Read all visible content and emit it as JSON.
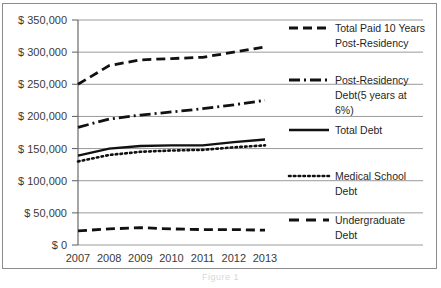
{
  "figure": {
    "caption": "Figure 1",
    "border_color": "#8c8c8c",
    "background": "#ffffff"
  },
  "chart_data": {
    "type": "line",
    "title": "",
    "xlabel": "",
    "ylabel": "",
    "grid": true,
    "legend_position": "right",
    "x": [
      2007,
      2008,
      2009,
      2010,
      2011,
      2012,
      2013
    ],
    "categories": [
      "2007",
      "2008",
      "2009",
      "2010",
      "2011",
      "2012",
      "2013"
    ],
    "ylim": [
      0,
      350000
    ],
    "yticks": [
      0,
      50000,
      100000,
      150000,
      200000,
      250000,
      300000,
      350000
    ],
    "ytick_labels": [
      "$ 0",
      "$ 50,000",
      "$ 100,000",
      "$ 150,000",
      "$ 200,000",
      "$ 250,000",
      "$ 300,000",
      "$ 350,000"
    ],
    "xtick_labels": [
      "2007",
      "2008",
      "2009",
      "2010",
      "2011",
      "2012",
      "2013"
    ],
    "series": [
      {
        "name": "Total Paid 10 Years Post-Residency",
        "values": [
          250000,
          279000,
          288000,
          290000,
          292000,
          300000,
          308000
        ],
        "style": "dashed",
        "color": "#111111"
      },
      {
        "name": "Post-Residency Debt(5 years at 6%)",
        "values": [
          183000,
          196000,
          202000,
          207000,
          212000,
          218000,
          225000
        ],
        "style": "dash-dot",
        "color": "#111111"
      },
      {
        "name": "Total Debt",
        "values": [
          139000,
          150000,
          154000,
          155000,
          155000,
          160000,
          164000
        ],
        "style": "solid",
        "color": "#111111"
      },
      {
        "name": "Medical School Debt",
        "values": [
          130000,
          140000,
          145000,
          147000,
          148000,
          152000,
          155000
        ],
        "style": "dotted",
        "color": "#111111"
      },
      {
        "name": "Undergraduate Debt",
        "values": [
          22000,
          25000,
          27000,
          25000,
          24000,
          24000,
          23000
        ],
        "style": "dashed",
        "color": "#111111"
      }
    ]
  },
  "legend": {
    "entries": [
      {
        "label_line1": "Total Paid 10 Years",
        "label_line2": "Post-Residency",
        "label_line3": "",
        "style": "dashed"
      },
      {
        "label_line1": "Post-Residency",
        "label_line2": "Debt(5 years at",
        "label_line3": "6%)",
        "style": "dash-dot"
      },
      {
        "label_line1": "Total Debt",
        "label_line2": "",
        "label_line3": "",
        "style": "solid"
      },
      {
        "label_line1": "Medical School",
        "label_line2": "Debt",
        "label_line3": "",
        "style": "dotted"
      },
      {
        "label_line1": "Undergraduate",
        "label_line2": "Debt",
        "label_line3": "",
        "style": "dashed-sparse"
      }
    ]
  }
}
